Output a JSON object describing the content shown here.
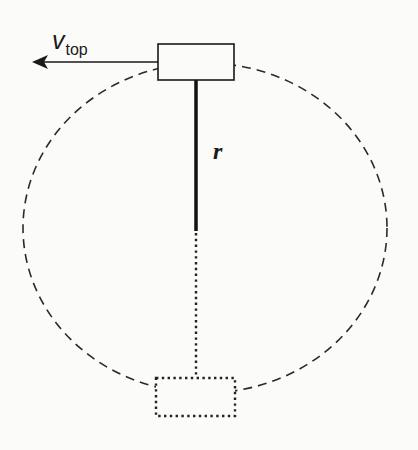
{
  "labels": {
    "velocity_symbol": "v",
    "velocity_subscript": "top",
    "radius_symbol": "r"
  },
  "colors": {
    "stroke": "#222222",
    "background": "#fbfbfa"
  },
  "elements": {
    "top_box": {
      "style": "solid",
      "x": 158,
      "y": 44,
      "width": 76,
      "height": 36
    },
    "bottom_box": {
      "style": "dotted",
      "x": 156,
      "y": 378,
      "width": 79,
      "height": 38
    },
    "rod": {
      "style": "thick-solid",
      "x": 196,
      "y1": 80,
      "y2": 231
    },
    "rod_extension": {
      "style": "dotted",
      "x": 196,
      "y1": 231,
      "y2": 378
    },
    "circular_path": {
      "style": "dashed",
      "cx": 205,
      "cy": 228,
      "rx": 182,
      "ry": 165
    },
    "velocity_arrow": {
      "direction": "left",
      "from_x": 158,
      "to_x": 32,
      "y": 62
    }
  }
}
